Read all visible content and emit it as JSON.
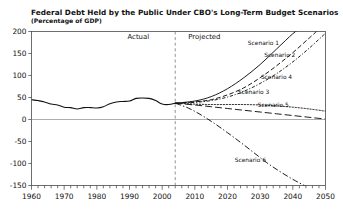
{
  "chart_data": {
    "type": "line",
    "title": "Federal Debt Held by the Public Under CBO's Long-Term Budget Scenarios",
    "subtitle": "(Percentage of GDP)",
    "xlabel": "",
    "ylabel": "",
    "xlim": [
      1960,
      2050
    ],
    "ylim": [
      -150,
      200
    ],
    "xticks": [
      1960,
      1970,
      1980,
      1990,
      2000,
      2010,
      2020,
      2030,
      2040,
      2050
    ],
    "yticks": [
      -150,
      -100,
      -50,
      0,
      50,
      100,
      150,
      200
    ],
    "minor_tick_interval": 2,
    "grid": false,
    "zero_gridline": true,
    "legend_position": "inline-labels",
    "annotations": [
      {
        "text": "Actual",
        "x": 1996,
        "y": 183
      },
      {
        "text": "Projected",
        "x": 2008,
        "y": 183
      }
    ],
    "divider": {
      "x": 2004,
      "label": "actual-projected-divider",
      "style": "dashed"
    },
    "historical": {
      "name": "Actual",
      "style": "solid",
      "x": [
        1960,
        1962,
        1964,
        1966,
        1968,
        1970,
        1972,
        1974,
        1976,
        1978,
        1980,
        1982,
        1984,
        1986,
        1988,
        1990,
        1992,
        1994,
        1996,
        1998,
        2000,
        2002,
        2004
      ],
      "y": [
        45,
        43,
        40,
        35,
        33,
        28,
        27,
        24,
        27,
        27,
        26,
        29,
        36,
        40,
        41,
        42,
        48,
        49,
        48,
        43,
        35,
        34,
        37
      ]
    },
    "series": [
      {
        "name": "Scenario 1",
        "style": "solid",
        "label_x": 2031,
        "label_y": 170,
        "x": [
          2004,
          2010,
          2015,
          2020,
          2025,
          2030,
          2035,
          2040,
          2042
        ],
        "y": [
          37,
          42,
          52,
          70,
          95,
          125,
          160,
          195,
          205
        ]
      },
      {
        "name": "Scenario 2",
        "style": "dashed",
        "label_x": 2036,
        "label_y": 142,
        "x": [
          2004,
          2010,
          2015,
          2020,
          2025,
          2030,
          2035,
          2040,
          2045,
          2048
        ],
        "y": [
          37,
          40,
          45,
          56,
          72,
          95,
          122,
          152,
          185,
          205
        ]
      },
      {
        "name": "Scenario 4",
        "style": "dashdot-fine",
        "label_x": 2035,
        "label_y": 92,
        "x": [
          2004,
          2010,
          2015,
          2020,
          2025,
          2030,
          2035,
          2040,
          2045,
          2050
        ],
        "y": [
          37,
          39,
          43,
          51,
          64,
          82,
          104,
          131,
          162,
          196
        ]
      },
      {
        "name": "Scenario 3",
        "style": "dotted",
        "label_x": 2028,
        "label_y": 58,
        "x": [
          2004,
          2010,
          2015,
          2020,
          2025,
          2030,
          2035,
          2040,
          2045,
          2050
        ],
        "y": [
          37,
          35,
          34,
          34,
          34,
          33,
          31,
          28,
          24,
          19
        ]
      },
      {
        "name": "Scenario 5",
        "style": "longdash",
        "label_x": 2034,
        "label_y": 28,
        "x": [
          2004,
          2010,
          2015,
          2020,
          2025,
          2030,
          2035,
          2040,
          2045,
          2050
        ],
        "y": [
          37,
          33,
          29,
          25,
          21,
          17,
          13,
          9,
          5,
          1
        ]
      },
      {
        "name": "Scenario 6",
        "style": "dashdot",
        "label_x": 2027,
        "label_y": -96,
        "x": [
          2004,
          2008,
          2012,
          2016,
          2020,
          2024,
          2028,
          2032,
          2036,
          2040,
          2044
        ],
        "y": [
          37,
          26,
          10,
          -9,
          -30,
          -52,
          -75,
          -98,
          -118,
          -136,
          -152
        ]
      }
    ]
  }
}
